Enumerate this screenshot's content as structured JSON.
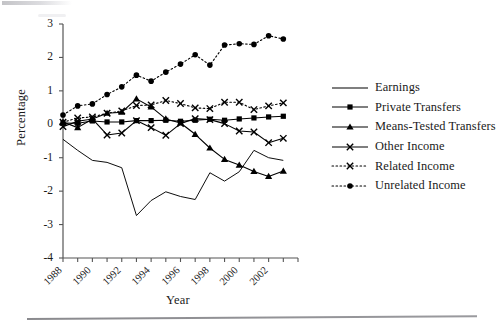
{
  "chart_data": {
    "type": "line",
    "title": "",
    "xlabel": "Year",
    "ylabel": "Percentage",
    "xlim": [
      1988,
      2004
    ],
    "ylim": [
      -4,
      3
    ],
    "grid": false,
    "legend_position": "right",
    "y_ticks": [
      "3",
      "2",
      "1",
      "0",
      "-1",
      "-2",
      "-3",
      "-4"
    ],
    "y_tick_values": [
      3,
      2,
      1,
      0,
      -1,
      -2,
      -3,
      -4
    ],
    "x_ticks": [
      "1988",
      "1990",
      "1992",
      "1994",
      "1996",
      "1998",
      "2000",
      "2002"
    ],
    "x_tick_values": [
      1988,
      1990,
      1992,
      1994,
      1996,
      1998,
      2000,
      2002
    ],
    "x_minor_tick_values": [
      1989,
      1991,
      1993,
      1995,
      1997,
      1999,
      2001,
      2003,
      2004
    ],
    "x": [
      1988,
      1989,
      1990,
      1991,
      1992,
      1993,
      1994,
      1995,
      1996,
      1997,
      1998,
      1999,
      2000,
      2001,
      2002,
      2003
    ],
    "series": [
      {
        "name": "Earnings",
        "marker": "none",
        "linestyle": "solid",
        "color": "#000000",
        "values": [
          -0.45,
          -0.78,
          -1.08,
          -1.14,
          -1.3,
          -2.73,
          -2.28,
          -2.02,
          -2.16,
          -2.25,
          -1.45,
          -1.7,
          -1.42,
          -0.78,
          -1.0,
          -1.08
        ]
      },
      {
        "name": "Private Transfers",
        "marker": "square",
        "linestyle": "solid",
        "color": "#000000",
        "values": [
          0.04,
          0.03,
          0.1,
          0.07,
          0.07,
          0.11,
          0.11,
          0.12,
          0.09,
          0.12,
          0.15,
          0.12,
          0.16,
          0.19,
          0.22,
          0.24
        ]
      },
      {
        "name": "Means-Tested Transfers",
        "marker": "triangle",
        "linestyle": "solid",
        "color": "#000000",
        "values": [
          0.07,
          -0.1,
          0.16,
          0.33,
          0.36,
          0.76,
          0.52,
          0.16,
          0.04,
          -0.3,
          -0.71,
          -1.05,
          -1.22,
          -1.41,
          -1.56,
          -1.4
        ]
      },
      {
        "name": "Other Income",
        "marker": "x",
        "linestyle": "solid",
        "color": "#000000",
        "values": [
          -0.07,
          0.09,
          0.16,
          -0.32,
          -0.26,
          0.11,
          -0.1,
          -0.33,
          0.02,
          0.17,
          0.14,
          0.02,
          -0.2,
          -0.23,
          -0.55,
          -0.42
        ]
      },
      {
        "name": "Related Income",
        "marker": "x",
        "linestyle": "dotted",
        "color": "#000000",
        "values": [
          0.06,
          0.19,
          0.22,
          0.33,
          0.4,
          0.56,
          0.58,
          0.71,
          0.62,
          0.49,
          0.47,
          0.66,
          0.66,
          0.44,
          0.55,
          0.64
        ]
      },
      {
        "name": "Unrelated Income",
        "marker": "circle",
        "linestyle": "dotted",
        "color": "#000000",
        "values": [
          0.28,
          0.55,
          0.61,
          0.89,
          1.12,
          1.47,
          1.29,
          1.56,
          1.8,
          2.08,
          1.77,
          2.37,
          2.41,
          2.39,
          2.65,
          2.55
        ]
      }
    ]
  },
  "legend": {
    "items": [
      {
        "label": "Earnings",
        "marker": "none",
        "linestyle": "solid"
      },
      {
        "label": "Private Transfers",
        "marker": "square",
        "linestyle": "solid"
      },
      {
        "label": "Means-Tested Transfers",
        "marker": "triangle",
        "linestyle": "solid"
      },
      {
        "label": "Other Income",
        "marker": "x",
        "linestyle": "solid"
      },
      {
        "label": "Related Income",
        "marker": "x",
        "linestyle": "dotted"
      },
      {
        "label": "Unrelated Income",
        "marker": "circle",
        "linestyle": "dotted"
      }
    ]
  },
  "axes": {
    "y_title": "Percentage",
    "x_title": "Year"
  },
  "colors": {
    "ink": "#000000",
    "axis": "#555555",
    "rule": "#8a8a8e"
  }
}
